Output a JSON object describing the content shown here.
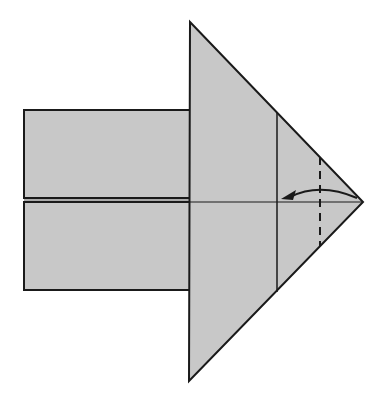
{
  "diagram": {
    "type": "origami-step",
    "colors": {
      "paper": "#c8c8c8",
      "line": "#1a1a1a",
      "background": "#ffffff"
    },
    "elements": {
      "left_rect_top": {
        "x": 24,
        "y": 110,
        "w": 166,
        "h": 88
      },
      "left_rect_bottom": {
        "x": 24,
        "y": 202,
        "w": 166,
        "h": 88
      },
      "triangle": {
        "points": "190,22 363,202 189,381"
      },
      "crease_vertical": {
        "x": 277,
        "y1": 113,
        "y2": 291
      },
      "valley_fold_dashed": {
        "x": 320,
        "y1": 157,
        "y2": 247
      },
      "center_line": {
        "x1": 24,
        "x2": 363,
        "y": 202
      },
      "arrow": {
        "from": [
          360,
          200
        ],
        "to": [
          282,
          198
        ],
        "label": "fold"
      }
    }
  }
}
